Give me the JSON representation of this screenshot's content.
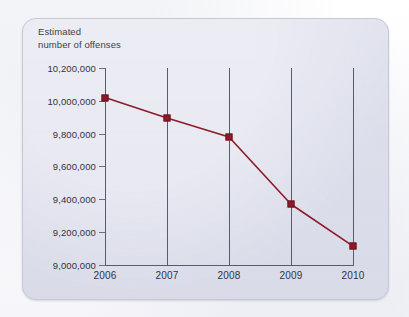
{
  "chart_data": {
    "type": "line",
    "title": "",
    "axis_title": "Estimated\nnumber of offenses",
    "xlabel": "",
    "ylabel": "Estimated number of offenses",
    "categories": [
      "2006",
      "2007",
      "2008",
      "2009",
      "2010"
    ],
    "x": [
      2006,
      2007,
      2008,
      2009,
      2010
    ],
    "values": [
      10020000,
      9895000,
      9780000,
      9370000,
      9115000
    ],
    "ylim": [
      9000000,
      10200000
    ],
    "ytick_values": [
      10200000,
      10000000,
      9800000,
      9600000,
      9400000,
      9200000,
      9000000
    ],
    "ytick_labels": [
      "10,200,000",
      "10,000,000",
      "9,800,000",
      "9,600,000",
      "9,400,000",
      "9,200,000",
      "9,000,000"
    ],
    "grid": "vertical-only",
    "legend": "none",
    "series": [
      {
        "name": "Estimated number of offenses",
        "color": "#8d1b27",
        "marker": "square",
        "values": [
          10020000,
          9895000,
          9780000,
          9370000,
          9115000
        ]
      }
    ],
    "colors": {
      "line": "#8d1b27",
      "marker_fill": "#8d1b27",
      "marker_edge": "#6e1420",
      "axis": "#575c6b",
      "gridline": "#575c6b",
      "panel_background": "#dcdeeb",
      "page_background": "#fdfdfd",
      "text": "#2f333f"
    }
  }
}
